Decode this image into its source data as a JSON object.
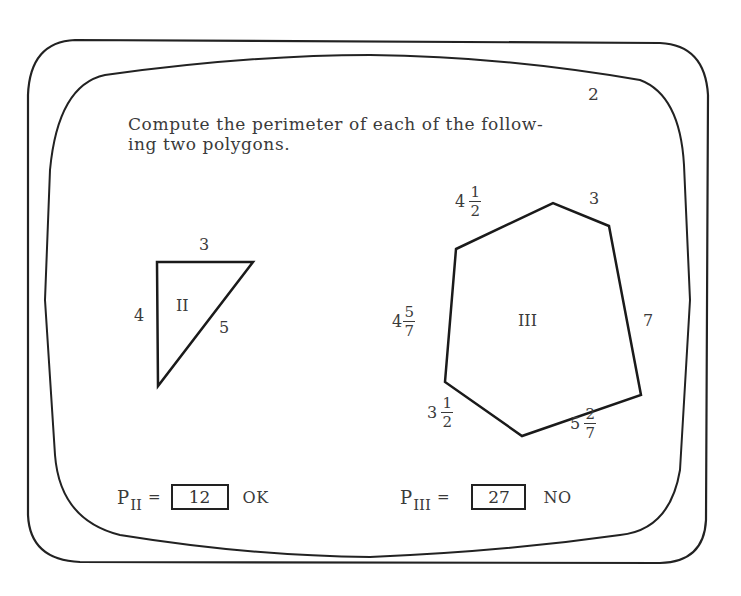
{
  "page": {
    "number": "2",
    "prompt_lines": [
      "Compute the perimeter of each of the follow-",
      "ing two polygons."
    ]
  },
  "polygons": [
    {
      "id": "II",
      "label": "II",
      "shape": "right-triangle",
      "sides": [
        {
          "position": "top",
          "whole": "3",
          "num": "",
          "den": ""
        },
        {
          "position": "left",
          "whole": "4",
          "num": "",
          "den": ""
        },
        {
          "position": "hypotenuse",
          "whole": "5",
          "num": "",
          "den": ""
        }
      ]
    },
    {
      "id": "III",
      "label": "III",
      "shape": "hexagon",
      "sides": [
        {
          "position": "upper-left",
          "whole": "4",
          "num": "1",
          "den": "2"
        },
        {
          "position": "upper-right",
          "whole": "3",
          "num": "",
          "den": ""
        },
        {
          "position": "right",
          "whole": "7",
          "num": "",
          "den": ""
        },
        {
          "position": "bottom-right",
          "whole": "5",
          "num": "2",
          "den": "7"
        },
        {
          "position": "bottom-left",
          "whole": "3",
          "num": "1",
          "den": "2"
        },
        {
          "position": "left",
          "whole": "4",
          "num": "5",
          "den": "7"
        }
      ]
    }
  ],
  "answers": [
    {
      "label": "P",
      "subscript": "II",
      "equals": "=",
      "value": "12",
      "feedback": "OK"
    },
    {
      "label": "P",
      "subscript": "III",
      "equals": "=",
      "value": "27",
      "feedback": "NO"
    }
  ]
}
